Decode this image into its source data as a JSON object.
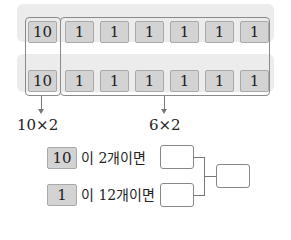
{
  "rows": [
    {
      "cells": [
        "10",
        "1",
        "1",
        "1",
        "1",
        "1",
        "1"
      ]
    },
    {
      "cells": [
        "10",
        "1",
        "1",
        "1",
        "1",
        "1",
        "1"
      ]
    }
  ],
  "labels": {
    "tens": "10×2",
    "ones": "6×2"
  },
  "statements": [
    {
      "unit": "10",
      "text": "이  2개이면"
    },
    {
      "unit": "1",
      "text": "이 12개이면"
    }
  ],
  "colors": {
    "cell_fill": "#d3d3d3",
    "band": "#ececec"
  }
}
